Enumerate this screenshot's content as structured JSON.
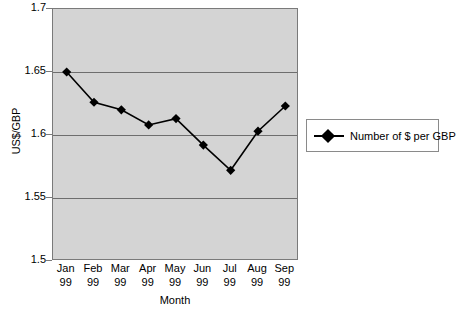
{
  "chart_data": {
    "type": "line",
    "title": "",
    "xlabel": "Month",
    "ylabel": "US$/GBP",
    "categories": [
      "Jan 99",
      "Feb 99",
      "Mar 99",
      "Apr 99",
      "May 99",
      "Jun 99",
      "Jul 99",
      "Aug 99",
      "Sep 99"
    ],
    "category_lines": [
      {
        "month": "Jan",
        "year": "99"
      },
      {
        "month": "Feb",
        "year": "99"
      },
      {
        "month": "Mar",
        "year": "99"
      },
      {
        "month": "Apr",
        "year": "99"
      },
      {
        "month": "May",
        "year": "99"
      },
      {
        "month": "Jun",
        "year": "99"
      },
      {
        "month": "Jul",
        "year": "99"
      },
      {
        "month": "Aug",
        "year": "99"
      },
      {
        "month": "Sep",
        "year": "99"
      }
    ],
    "series": [
      {
        "name": "Number of $ per GBP",
        "values": [
          1.65,
          1.626,
          1.62,
          1.608,
          1.613,
          1.592,
          1.572,
          1.603,
          1.623
        ],
        "color": "#000000",
        "marker": "diamond"
      }
    ],
    "ylim": [
      1.5,
      1.7
    ],
    "yticks": [
      1.7,
      1.65,
      1.6,
      1.55,
      1.5
    ],
    "ytick_labels": [
      "1.7",
      "1.65",
      "1.6",
      "1.55",
      "1.5"
    ],
    "gridlines": [
      1.65,
      1.6,
      1.55
    ],
    "grid": true,
    "grid_axis": "y",
    "legend_position": "right",
    "plot_background": "#d4d4d4",
    "figure_background": "#ffffff",
    "grid_color": "#6e6e6e",
    "axis_color": "#7a7a7a"
  },
  "legend": {
    "entries": [
      {
        "label": "Number of $ per GBP"
      }
    ]
  }
}
